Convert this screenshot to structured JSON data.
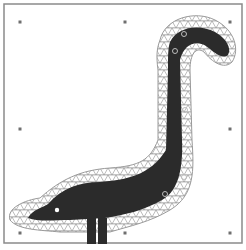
{
  "figure": {
    "colors": {
      "background": "#ffffff",
      "frame": "#8a8a8a",
      "silhouette": "#2b2b2b",
      "mesh": "#8c8c8c",
      "control_point": "#6f6f6f",
      "handle": "#bdbdbd"
    },
    "frame": {
      "x": 4,
      "y": 4,
      "width": 238,
      "height": 239
    },
    "control_points": [
      {
        "x": 20,
        "y": 22
      },
      {
        "x": 125,
        "y": 22
      },
      {
        "x": 230,
        "y": 22
      },
      {
        "x": 20,
        "y": 129
      },
      {
        "x": 230,
        "y": 129
      },
      {
        "x": 20,
        "y": 233
      },
      {
        "x": 125,
        "y": 233
      },
      {
        "x": 230,
        "y": 233
      }
    ],
    "handles": [
      {
        "x": 184,
        "y": 34
      },
      {
        "x": 175,
        "y": 51
      },
      {
        "x": 185,
        "y": 110
      },
      {
        "x": 184,
        "y": 177
      },
      {
        "x": 165,
        "y": 194
      }
    ],
    "eye": {
      "x": 57,
      "y": 210
    }
  }
}
